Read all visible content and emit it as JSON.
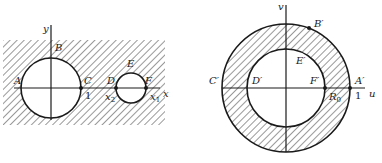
{
  "diagram": {
    "left": {
      "name": "z-plane",
      "axes": {
        "x_label": "x",
        "y_label": "y"
      },
      "points": {
        "A": "A",
        "B": "B",
        "C": "C",
        "D": "D",
        "E": "E",
        "F": "F"
      },
      "tick_one": "1",
      "x1": {
        "base": "x",
        "sub": "1"
      },
      "x2": {
        "base": "x",
        "sub": "2"
      },
      "regions": {
        "large_circle": "unit circle centered at origin",
        "small_circle": "circle with diameter from x2 to x1",
        "hatched": "exterior of both circles"
      }
    },
    "right": {
      "name": "w-plane",
      "axes": {
        "u_label": "u",
        "v_label": "v"
      },
      "points": {
        "A": "A′",
        "B": "B′",
        "C": "C′",
        "D": "D′",
        "E": "E′",
        "F": "F′"
      },
      "tick_one": "1",
      "R0": {
        "base": "R",
        "sub": "0"
      },
      "regions": {
        "outer_circle": "|w| = 1",
        "inner_circle": "|w| = R0",
        "hatched": "annulus R0 < |w| < 1"
      }
    },
    "colors": {
      "stroke": "#1a1a1a",
      "background": "#ffffff"
    }
  }
}
